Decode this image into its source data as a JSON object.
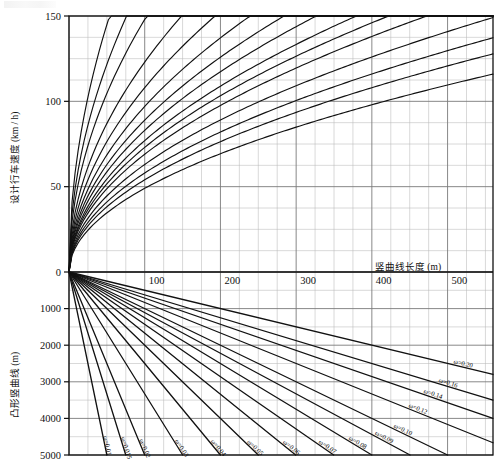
{
  "chart": {
    "type": "line",
    "title": "",
    "upper_panel": {
      "ylabel": "设计行车速度 (km / h)",
      "yticks": [
        0,
        50,
        100,
        150
      ],
      "ylim": [
        0,
        150
      ],
      "ytick_labels": [
        "0",
        "50",
        "100",
        "150"
      ]
    },
    "lower_panel": {
      "ylabel": "凸形竖曲线 (m)",
      "yticks": [
        1000,
        2000,
        3000,
        4000,
        5000
      ],
      "ylim": [
        0,
        5000
      ],
      "ytick_labels": [
        "1000",
        "2000",
        "3000",
        "4000",
        "5000"
      ],
      "direction": "inverted"
    },
    "xlabel": "竖曲线长度 (m)",
    "xticks": [
      100,
      200,
      300,
      400,
      500
    ],
    "xtick_labels": [
      "100",
      "200",
      "300",
      "400",
      "500"
    ],
    "xlim": [
      0,
      560
    ],
    "grid": true,
    "grid_step_x": 25,
    "grid_step_y_upper": 12.5,
    "grid_step_y_lower": 500
  },
  "chart_data": {
    "type": "line",
    "title": "",
    "xlabel": "竖曲线长度 (m)",
    "ylabel_upper": "设计行车速度 (km / h)",
    "ylabel_lower": "凸形竖曲线 (m)",
    "xlim": [
      0,
      560
    ],
    "ylim_upper": [
      0,
      150
    ],
    "ylim_lower": [
      0,
      5000
    ],
    "grid": true,
    "legend": "inline-curve-labels",
    "omega_symbol": "ω",
    "upper_series": [
      {
        "name": "ω=0.01",
        "k": 20.5,
        "values_at_x": {
          "100": 110.0,
          "200": 128.0,
          "300": 138.0,
          "400": 145.0,
          "500": 150.0
        }
      },
      {
        "name": "ω=0.015",
        "k": 17.2,
        "values_at_x": {
          "100": 92.0,
          "200": 108.0,
          "300": 117.0,
          "400": 124.0,
          "500": 129.0
        }
      },
      {
        "name": "ω=0.02",
        "k": 14.8,
        "values_at_x": {
          "100": 79.0,
          "200": 93.5,
          "300": 101.5,
          "400": 107.0,
          "500": 111.5
        }
      },
      {
        "name": "ω=0.03",
        "k": 12.3,
        "values_at_x": {
          "100": 66.0,
          "200": 78.0,
          "300": 84.5,
          "400": 89.0,
          "500": 92.5
        }
      },
      {
        "name": "ω=0.04",
        "k": 10.8,
        "values_at_x": {
          "100": 57.5,
          "200": 68.0,
          "300": 74.0,
          "400": 78.0,
          "500": 81.0
        }
      },
      {
        "name": "ω=0.05",
        "k": 9.7,
        "values_at_x": {
          "100": 52.0,
          "200": 61.5,
          "300": 66.5,
          "400": 70.0,
          "500": 73.0
        }
      },
      {
        "name": "ω=0.06",
        "k": 8.9,
        "values_at_x": {
          "100": 47.5,
          "200": 56.0,
          "300": 61.0,
          "400": 64.0,
          "500": 67.0
        }
      },
      {
        "name": "ω=0.07",
        "k": 8.3,
        "values_at_x": {
          "100": 44.0,
          "200": 52.0,
          "300": 56.5,
          "400": 59.5,
          "500": 62.0
        }
      },
      {
        "name": "ω=0.08",
        "k": 7.7,
        "values_at_x": {
          "100": 41.0,
          "200": 48.5,
          "300": 52.5,
          "400": 55.5,
          "500": 58.0
        }
      },
      {
        "name": "ω=0.09",
        "k": 7.3,
        "values_at_x": {
          "100": 39.0,
          "200": 46.0,
          "300": 50.0,
          "400": 52.5,
          "500": 55.0
        }
      },
      {
        "name": "ω=0.10",
        "k": 6.9,
        "values_at_x": {
          "100": 37.0,
          "200": 43.5,
          "300": 47.0,
          "400": 50.0,
          "500": 52.0
        }
      },
      {
        "name": "ω=0.12",
        "k": 6.3,
        "values_at_x": {
          "100": 33.5,
          "200": 39.5,
          "300": 43.0,
          "400": 45.5,
          "500": 47.5
        }
      },
      {
        "name": "ω=0.14",
        "k": 5.8,
        "values_at_x": {
          "100": 31.0,
          "200": 36.5,
          "300": 40.0,
          "400": 42.0,
          "500": 44.0
        }
      },
      {
        "name": "ω=0.16",
        "k": 5.4,
        "values_at_x": {
          "100": 29.0,
          "200": 34.0,
          "300": 37.0,
          "400": 39.0,
          "500": 41.0
        }
      },
      {
        "name": "ω=0.20",
        "k": 4.9,
        "values_at_x": {
          "100": 26.0,
          "200": 30.5,
          "300": 33.0,
          "400": 35.0,
          "500": 36.5
        }
      }
    ],
    "lower_series": [
      {
        "name": "ω=0.01",
        "omega": 0.01,
        "slope_R_per_L": 100,
        "label_x": 48,
        "R_at_500": 50000
      },
      {
        "name": "ω=0.015",
        "omega": 0.015,
        "slope_R_per_L": 66.7,
        "label_x": 73,
        "R_at_500": 33333
      },
      {
        "name": "ω=0.02",
        "omega": 0.02,
        "slope_R_per_L": 50,
        "label_x": 100,
        "R_at_500": 25000
      },
      {
        "name": "ω=0.03",
        "omega": 0.03,
        "slope_R_per_L": 33.3,
        "label_x": 150,
        "R_at_500": 16667
      },
      {
        "name": "ω=0.04",
        "omega": 0.04,
        "slope_R_per_L": 25,
        "label_x": 200,
        "R_at_500": 12500
      },
      {
        "name": "ω=0.05",
        "omega": 0.05,
        "slope_R_per_L": 20,
        "label_x": 250,
        "R_at_500": 10000
      },
      {
        "name": "ω=0.06",
        "omega": 0.06,
        "slope_R_per_L": 16.7,
        "label_x": 300,
        "R_at_500": 8333
      },
      {
        "name": "ω=0.07",
        "omega": 0.07,
        "slope_R_per_L": 14.3,
        "label_x": 340,
        "R_at_500": 7143
      },
      {
        "name": "ω=0.08",
        "omega": 0.08,
        "slope_R_per_L": 12.5,
        "label_x": 380,
        "R_at_500": 6250
      },
      {
        "name": "ω=0.09",
        "omega": 0.09,
        "slope_R_per_L": 11.1,
        "label_x": 415,
        "R_at_500": 5556
      },
      {
        "name": "ω=0.10",
        "omega": 0.1,
        "slope_R_per_L": 10,
        "label_x": 440,
        "R_at_500": 5000
      },
      {
        "name": "ω=0.12",
        "omega": 0.12,
        "slope_R_per_L": 8.33,
        "label_x": 460,
        "R_at_500": 4167
      },
      {
        "name": "ω=0.14",
        "omega": 0.14,
        "slope_R_per_L": 7.14,
        "label_x": 480,
        "R_at_500": 3571
      },
      {
        "name": "ω=0.16",
        "omega": 0.16,
        "slope_R_per_L": 6.25,
        "label_x": 500,
        "R_at_500": 3125
      },
      {
        "name": "ω=0.20",
        "omega": 0.2,
        "slope_R_per_L": 5.0,
        "label_x": 520,
        "R_at_500": 2500
      }
    ]
  }
}
